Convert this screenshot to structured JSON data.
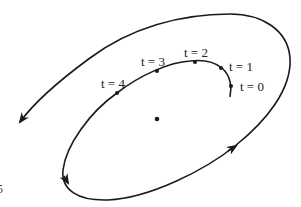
{
  "diagram": {
    "type": "spiral-trajectory",
    "curve_color": "#1a1a1a",
    "background": "#ffffff",
    "center_point": {
      "x": 157,
      "y": 119
    },
    "markers": [
      {
        "id": "t0",
        "label": "t = 0",
        "x": 231,
        "y": 86
      },
      {
        "id": "t1",
        "label": "t = 1",
        "x": 221,
        "y": 68
      },
      {
        "id": "t2",
        "label": "t = 2",
        "x": 195,
        "y": 62
      },
      {
        "id": "t3",
        "label": "t = 3",
        "x": 157,
        "y": 71
      },
      {
        "id": "t4",
        "label": "t = 4",
        "x": 117,
        "y": 93
      }
    ],
    "edge_glyph": "5"
  }
}
